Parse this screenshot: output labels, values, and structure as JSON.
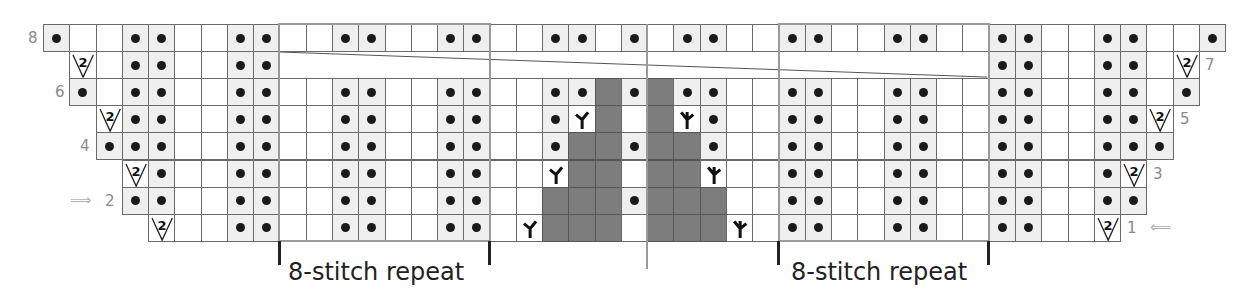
{
  "chart": {
    "origin_x": 43,
    "origin_y": 24,
    "cell_w": 26.27,
    "cell_h": 27.1,
    "columns": 45,
    "rows_count": 8,
    "legend_codes": {
      "K": "knit (blank)",
      "P": "purl (dot)",
      "I": "increase 2 (V with 2)",
      "L": "left-leaning decrease",
      "R": "right-leaning decrease",
      "G": "no stitch (gray)",
      "-": "outside chart",
      "C": "cable crossing"
    },
    "rows": [
      {
        "number": 8,
        "label_side": "left",
        "cells": "PKKPPKKPPKKPPKKPPKKPPKPKPPKKPPKKPPKKPPKKPPKKP"
      },
      {
        "number": 7,
        "label_side": "right",
        "cells": "-IKPPKKPPCCCCCCPPKKPPLKRPPKKPPCCCCCCPPKKPPKI-"
      },
      {
        "number": 6,
        "label_side": "left",
        "cells": "-PKPPKKPPKKPPKKPPKKPPGPGPPKKPPKKPPKKPPKKPPKP-"
      },
      {
        "number": 5,
        "label_side": "right",
        "cells": "--IPPKKPPKKPPKKPPKKPLGKGRPKKPPKKPPKKPPKKPPI--"
      },
      {
        "number": 4,
        "label_side": "left",
        "cells": "--PPPKKPPKKPPKKPPKKPGGPGGPKKPPKKPPKKPPKKPPP--"
      },
      {
        "number": 3,
        "label_side": "right",
        "cells": "---IPKKPPKKPPKKPPKKLGGKGGRKKPPKKPPKKPPKKPI---"
      },
      {
        "number": 2,
        "label_side": "left",
        "cells": "---PPKKPPKKPPKKPPKKGGGPGGGKKPPKKPPKKPPKKPP---"
      },
      {
        "number": 1,
        "label_side": "right",
        "cells": "----IKKPPKKPPKKPPKLGGGKGGGRKPPKKPPKKPPKKI----"
      }
    ],
    "row_labels": [
      {
        "text": "8",
        "x": 28,
        "row": 8
      },
      {
        "text": "7",
        "x": 1205,
        "row": 7
      },
      {
        "text": "6",
        "x": 55,
        "row": 6
      },
      {
        "text": "5",
        "x": 1180,
        "row": 5
      },
      {
        "text": "4",
        "x": 80,
        "row": 4
      },
      {
        "text": "3",
        "x": 1153,
        "row": 3
      },
      {
        "text": "2",
        "x": 105,
        "row": 2
      },
      {
        "text": "1",
        "x": 1127,
        "row": 1
      }
    ],
    "arrows": {
      "row2": {
        "glyph": "⟹",
        "direction": "right",
        "x": 70
      },
      "row1": {
        "glyph": "⟸",
        "direction": "left",
        "x": 1150
      }
    },
    "increase_symbol_text": "2",
    "decrease_left_glyph": "ᛉ",
    "decrease_right_glyph": "ᚴ",
    "repeats": [
      {
        "label": "8-stitch repeat",
        "start_col": 9,
        "end_col": 17,
        "label_x": 288
      },
      {
        "label": "8-stitch repeat",
        "start_col": 28,
        "end_col": 36,
        "label_x": 791
      }
    ],
    "center_col": 22
  }
}
